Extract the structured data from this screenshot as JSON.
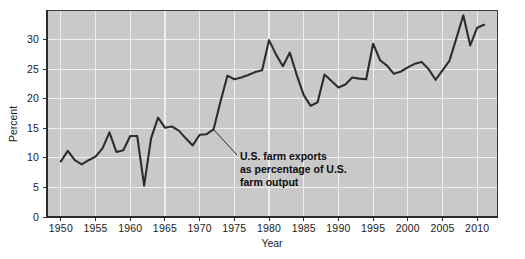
{
  "chart_data": {
    "type": "line",
    "title": "",
    "xlabel": "Year",
    "ylabel": "Percent",
    "xlim": [
      1948,
      2013
    ],
    "ylim": [
      0,
      35
    ],
    "grid": true,
    "legend_position": "none",
    "xticks": [
      1950,
      1955,
      1960,
      1965,
      1970,
      1975,
      1980,
      1985,
      1990,
      1995,
      2000,
      2005,
      2010
    ],
    "yticks": [
      0,
      5,
      10,
      15,
      20,
      25,
      30
    ],
    "series": [
      {
        "name": "U.S. farm exports as percentage of U.S. farm output",
        "color": "#2d2d2d",
        "x": [
          1950,
          1951,
          1952,
          1953,
          1954,
          1955,
          1956,
          1957,
          1958,
          1959,
          1960,
          1961,
          1962,
          1963,
          1964,
          1965,
          1966,
          1967,
          1968,
          1969,
          1970,
          1971,
          1972,
          1973,
          1974,
          1975,
          1976,
          1977,
          1978,
          1979,
          1980,
          1981,
          1982,
          1983,
          1984,
          1985,
          1986,
          1987,
          1988,
          1989,
          1990,
          1991,
          1992,
          1993,
          1994,
          1995,
          1996,
          1997,
          1998,
          1999,
          2000,
          2001,
          2002,
          2003,
          2004,
          2005,
          2006,
          2007,
          2008,
          2009,
          2010,
          2011
        ],
        "values": [
          9.4,
          11.2,
          9.6,
          8.9,
          9.6,
          10.2,
          11.6,
          14.3,
          11.0,
          11.3,
          13.7,
          13.7,
          5.3,
          13.3,
          16.8,
          15.1,
          15.3,
          14.6,
          13.3,
          12.1,
          13.9,
          14.0,
          14.8,
          19.5,
          23.9,
          23.3,
          23.6,
          24.0,
          24.5,
          24.8,
          29.9,
          27.5,
          25.5,
          27.8,
          24.0,
          20.6,
          18.8,
          19.4,
          24.1,
          23.0,
          21.9,
          22.4,
          23.6,
          23.4,
          23.3,
          29.3,
          26.5,
          25.6,
          24.2,
          24.6,
          25.3,
          25.9,
          26.2,
          25.0,
          23.2,
          24.8,
          26.4,
          30.2,
          34.1,
          29.0,
          32.0,
          32.5
        ]
      }
    ],
    "annotations": [
      {
        "name": "series-callout",
        "lines": [
          "U.S. farm exports",
          "as percentage of U.S.",
          "farm output"
        ],
        "points_to_year": 1972,
        "points_to_value": 14.8
      }
    ],
    "colors": {
      "plot_background": "#c9c9c9",
      "gridline": "#efefef",
      "line": "#2d2d2d",
      "text": "#1a1a1a",
      "page_background": "#ffffff"
    }
  }
}
